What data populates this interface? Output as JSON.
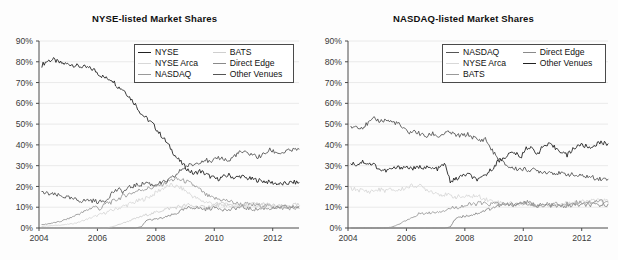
{
  "figure": {
    "background": "#fdfdfd",
    "panel_count": 2
  },
  "charts": [
    {
      "id": "nyse-listed",
      "title": "NYSE-listed Market Shares",
      "legend": [
        {
          "label": "NYSE",
          "color": "#222222"
        },
        {
          "label": "BATS",
          "color": "#cfcfcf"
        },
        {
          "label": "NYSE Arca",
          "color": "#d8d8d8"
        },
        {
          "label": "Direct Edge",
          "color": "#8a8a8a"
        },
        {
          "label": "NASDAQ",
          "color": "#9a9a9a"
        },
        {
          "label": "Other Venues",
          "color": "#555555"
        }
      ]
    },
    {
      "id": "nasdaq-listed",
      "title": "NASDAQ-listed Market Shares",
      "legend": [
        {
          "label": "NASDAQ",
          "color": "#555555"
        },
        {
          "label": "Direct Edge",
          "color": "#8a8a8a"
        },
        {
          "label": "NYSE Arca",
          "color": "#d8d8d8"
        },
        {
          "label": "Other Venues",
          "color": "#222222"
        },
        {
          "label": "BATS",
          "color": "#9a9a9a"
        }
      ]
    }
  ],
  "chart_data": [
    {
      "type": "line",
      "id": "nyse-listed",
      "title": "NYSE-listed Market Shares",
      "xlabel": "",
      "ylabel": "",
      "xlim": [
        2004.0,
        2012.9
      ],
      "ylim": [
        0,
        90
      ],
      "yticks": [
        0,
        10,
        20,
        30,
        40,
        50,
        60,
        70,
        80,
        90
      ],
      "ytick_labels": [
        "0%",
        "10%",
        "20%",
        "30%",
        "40%",
        "50%",
        "60%",
        "70%",
        "80%",
        "90%"
      ],
      "xticks": [
        2004,
        2006,
        2008,
        2010,
        2012
      ],
      "xtick_labels": [
        "2004",
        "2006",
        "2008",
        "2010",
        "2012"
      ],
      "grid": "horizontal",
      "legend_position": "upper-center",
      "x": [
        2004.1,
        2004.3,
        2004.5,
        2004.7,
        2004.9,
        2005.1,
        2005.3,
        2005.5,
        2005.7,
        2005.9,
        2006.1,
        2006.3,
        2006.5,
        2006.7,
        2006.9,
        2007.1,
        2007.3,
        2007.5,
        2007.7,
        2007.9,
        2008.1,
        2008.3,
        2008.5,
        2008.7,
        2008.9,
        2009.1,
        2009.3,
        2009.5,
        2009.7,
        2009.9,
        2010.1,
        2010.3,
        2010.5,
        2010.7,
        2010.9,
        2011.1,
        2011.3,
        2011.5,
        2011.7,
        2011.9,
        2012.1,
        2012.3,
        2012.5,
        2012.7,
        2012.9
      ],
      "series": [
        {
          "name": "NYSE",
          "color": "#222222",
          "values": [
            78.5,
            80.5,
            81.0,
            79.5,
            79.0,
            78.8,
            78.0,
            77.5,
            77.0,
            76.0,
            73.5,
            72.0,
            71.5,
            68.0,
            66.5,
            63.0,
            59.5,
            55.0,
            52.5,
            50.0,
            46.0,
            42.5,
            38.5,
            34.0,
            31.0,
            28.0,
            26.0,
            27.5,
            26.0,
            24.5,
            23.5,
            24.5,
            25.5,
            24.0,
            25.0,
            24.0,
            23.5,
            23.0,
            22.5,
            22.0,
            21.5,
            21.0,
            21.5,
            22.0,
            21.8
          ]
        },
        {
          "name": "NYSE Arca",
          "color": "#d8d8d8",
          "values": [
            0.8,
            1.0,
            1.2,
            1.4,
            1.6,
            2.0,
            2.5,
            3.5,
            4.5,
            5.5,
            6.5,
            7.5,
            8.5,
            9.5,
            10.5,
            11.5,
            12.5,
            13.5,
            14.5,
            16.0,
            18.0,
            19.5,
            20.5,
            20.0,
            19.0,
            17.0,
            15.0,
            13.5,
            12.5,
            12.0,
            11.5,
            11.0,
            11.0,
            10.5,
            10.5,
            10.5,
            10.5,
            11.0,
            11.0,
            10.5,
            10.5,
            10.0,
            10.0,
            10.0,
            10.0
          ]
        },
        {
          "name": "NASDAQ",
          "color": "#9a9a9a",
          "values": [
            1.5,
            2.0,
            2.5,
            3.0,
            4.0,
            5.0,
            6.5,
            7.5,
            9.0,
            10.5,
            9.0,
            12.0,
            12.5,
            14.0,
            15.5,
            16.5,
            17.5,
            18.5,
            19.0,
            19.5,
            20.5,
            21.5,
            23.0,
            23.5,
            23.0,
            22.0,
            20.5,
            18.5,
            16.0,
            14.5,
            14.0,
            13.5,
            13.0,
            12.0,
            11.5,
            11.5,
            11.0,
            11.0,
            11.0,
            10.5,
            10.0,
            9.5,
            9.5,
            9.5,
            9.5
          ]
        },
        {
          "name": "BATS",
          "color": "#cfcfcf",
          "values": [
            0,
            0,
            0,
            0,
            0,
            0,
            0,
            0,
            0,
            0,
            0,
            0,
            0.5,
            1.5,
            2.5,
            3.5,
            4.5,
            5.5,
            6.5,
            7.0,
            8.0,
            9.0,
            9.5,
            10.0,
            10.5,
            11.0,
            10.5,
            10.0,
            10.0,
            10.5,
            11.0,
            11.5,
            11.0,
            10.5,
            10.5,
            11.0,
            11.5,
            11.5,
            11.5,
            11.0,
            10.5,
            10.5,
            10.5,
            11.0,
            11.0
          ]
        },
        {
          "name": "Direct Edge",
          "color": "#8a8a8a",
          "values": [
            0,
            0,
            0,
            0,
            0,
            0,
            0,
            0,
            0,
            0,
            0,
            0,
            0,
            0,
            0,
            0,
            0,
            0.5,
            4.0,
            4.0,
            4.5,
            5.0,
            6.0,
            7.0,
            8.5,
            9.5,
            10.0,
            9.5,
            9.0,
            9.5,
            10.0,
            9.0,
            8.5,
            9.5,
            10.0,
            9.5,
            9.0,
            9.0,
            9.5,
            9.5,
            9.5,
            10.0,
            10.0,
            10.0,
            10.5
          ]
        },
        {
          "name": "Other Venues",
          "color": "#555555",
          "values": [
            17.0,
            16.5,
            16.0,
            15.5,
            15.0,
            14.0,
            13.5,
            13.0,
            13.5,
            13.0,
            12.5,
            13.5,
            17.0,
            18.5,
            17.5,
            19.5,
            20.5,
            21.0,
            22.0,
            20.5,
            21.5,
            22.0,
            23.5,
            25.5,
            28.5,
            30.0,
            30.5,
            32.0,
            33.0,
            31.0,
            34.0,
            33.5,
            32.0,
            35.0,
            36.5,
            36.0,
            35.5,
            34.0,
            35.5,
            37.5,
            36.5,
            36.0,
            37.0,
            37.5,
            38.0
          ]
        }
      ]
    },
    {
      "type": "line",
      "id": "nasdaq-listed",
      "title": "NASDAQ-listed Market Shares",
      "xlabel": "",
      "ylabel": "",
      "xlim": [
        2004.0,
        2012.9
      ],
      "ylim": [
        0,
        90
      ],
      "yticks": [
        0,
        10,
        20,
        30,
        40,
        50,
        60,
        70,
        80,
        90
      ],
      "ytick_labels": [
        "0%",
        "10%",
        "20%",
        "30%",
        "40%",
        "50%",
        "60%",
        "70%",
        "80%",
        "90%"
      ],
      "xticks": [
        2004,
        2006,
        2008,
        2010,
        2012
      ],
      "xtick_labels": [
        "2004",
        "2006",
        "2008",
        "2010",
        "2012"
      ],
      "grid": "horizontal",
      "legend_position": "upper-center",
      "x": [
        2004.1,
        2004.3,
        2004.5,
        2004.7,
        2004.9,
        2005.1,
        2005.3,
        2005.5,
        2005.7,
        2005.9,
        2006.1,
        2006.3,
        2006.5,
        2006.7,
        2006.9,
        2007.1,
        2007.3,
        2007.5,
        2007.7,
        2007.9,
        2008.1,
        2008.3,
        2008.5,
        2008.7,
        2008.9,
        2009.1,
        2009.3,
        2009.5,
        2009.7,
        2009.9,
        2010.1,
        2010.3,
        2010.5,
        2010.7,
        2010.9,
        2011.1,
        2011.3,
        2011.5,
        2011.7,
        2011.9,
        2012.1,
        2012.3,
        2012.5,
        2012.7,
        2012.9
      ],
      "series": [
        {
          "name": "NASDAQ",
          "color": "#555555",
          "values": [
            48.5,
            49.0,
            48.5,
            50.5,
            52.5,
            51.5,
            52.0,
            51.0,
            50.5,
            47.5,
            46.0,
            46.5,
            45.0,
            44.0,
            45.5,
            44.0,
            45.5,
            46.0,
            44.5,
            44.5,
            45.0,
            43.5,
            42.0,
            43.0,
            38.0,
            34.0,
            31.5,
            29.5,
            28.5,
            28.5,
            28.0,
            28.0,
            27.5,
            27.0,
            27.0,
            26.5,
            26.0,
            26.0,
            25.5,
            25.0,
            25.0,
            24.5,
            24.0,
            23.5,
            23.5
          ]
        },
        {
          "name": "NYSE Arca",
          "color": "#d8d8d8",
          "values": [
            19.0,
            18.5,
            18.0,
            17.5,
            18.0,
            18.5,
            18.0,
            18.5,
            18.0,
            19.0,
            20.0,
            20.5,
            20.0,
            18.5,
            17.5,
            16.5,
            16.0,
            15.5,
            15.0,
            15.0,
            15.0,
            15.5,
            15.0,
            14.0,
            13.0,
            12.5,
            12.0,
            12.0,
            11.5,
            11.5,
            11.5,
            11.0,
            11.0,
            11.0,
            11.0,
            11.5,
            11.5,
            12.0,
            12.5,
            12.5,
            12.5,
            13.0,
            13.0,
            13.5,
            13.0
          ]
        },
        {
          "name": "BATS",
          "color": "#9a9a9a",
          "values": [
            0,
            0,
            0,
            0,
            0,
            0,
            0,
            0.5,
            1.5,
            3.0,
            4.5,
            5.5,
            7.5,
            7.0,
            7.5,
            8.0,
            8.5,
            9.5,
            10.0,
            10.5,
            11.0,
            11.5,
            12.0,
            11.5,
            11.5,
            12.0,
            11.5,
            11.0,
            11.0,
            11.5,
            12.0,
            11.0,
            10.5,
            11.0,
            11.5,
            11.5,
            11.0,
            11.5,
            12.0,
            12.5,
            12.5,
            12.5,
            13.0,
            13.0,
            12.5
          ]
        },
        {
          "name": "Direct Edge",
          "color": "#8a8a8a",
          "values": [
            0,
            0,
            0,
            0,
            0,
            0,
            0,
            0,
            0,
            0,
            0,
            0,
            0,
            0,
            0,
            0,
            0,
            0.5,
            5.0,
            5.5,
            6.0,
            6.5,
            7.5,
            8.5,
            9.5,
            10.5,
            11.0,
            11.0,
            11.5,
            12.0,
            12.5,
            11.5,
            11.0,
            11.0,
            11.0,
            10.5,
            10.5,
            10.5,
            11.0,
            11.0,
            11.0,
            11.0,
            11.0,
            11.0,
            11.5
          ]
        },
        {
          "name": "Other Venues",
          "color": "#222222",
          "values": [
            31.5,
            30.5,
            32.0,
            31.0,
            30.5,
            28.0,
            27.5,
            28.5,
            29.0,
            29.5,
            29.0,
            28.5,
            29.5,
            29.0,
            28.5,
            28.5,
            31.0,
            22.5,
            23.5,
            25.0,
            26.0,
            24.0,
            23.0,
            25.5,
            28.0,
            31.5,
            33.5,
            35.5,
            36.5,
            33.5,
            39.0,
            38.0,
            36.0,
            39.5,
            40.0,
            38.5,
            37.0,
            35.0,
            38.0,
            40.0,
            39.5,
            38.5,
            40.5,
            41.0,
            40.5
          ]
        }
      ]
    }
  ]
}
